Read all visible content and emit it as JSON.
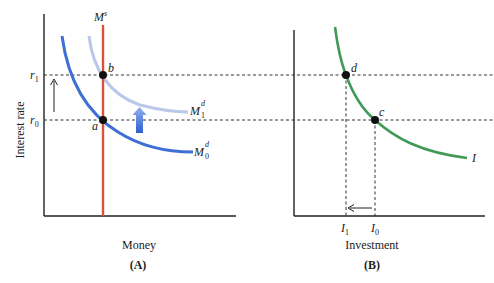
{
  "colors": {
    "axis": "#222222",
    "money_supply": "#d9533b",
    "money_demand_0": "#3f6fd4",
    "money_demand_1": "#b9c7ea",
    "investment_curve": "#3f9a55",
    "shift_arrow": "#3a6fd8",
    "dashed": "#333333",
    "point": "#111111"
  },
  "panel_a": {
    "caption": "(A)",
    "xlabel": "Money",
    "ylabel": "Interest rate",
    "supply_label": "M",
    "supply_sup": "s",
    "demand0_label": "M",
    "demand0_sup": "d",
    "demand0_sub": "0",
    "demand1_label": "M",
    "demand1_sup": "d",
    "demand1_sub": "1",
    "r1_label": "r",
    "r1_sub": "1",
    "r0_label": "r",
    "r0_sub": "0",
    "point_a": "a",
    "point_b": "b"
  },
  "panel_b": {
    "caption": "(B)",
    "xlabel": "Investment",
    "curve_label": "I",
    "point_c": "c",
    "point_d": "d",
    "i1_label": "I",
    "i1_sub": "1",
    "i0_label": "I",
    "i0_sub": "0"
  }
}
